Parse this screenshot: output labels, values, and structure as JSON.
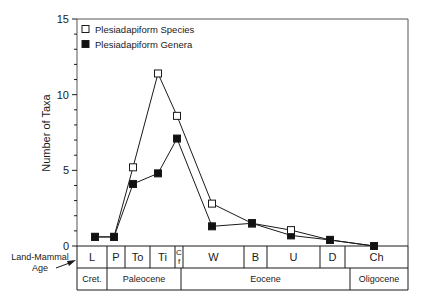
{
  "chart_data": {
    "type": "line",
    "title": "",
    "xlabel": "Land-Mammal Age",
    "ylabel": "Number of Taxa",
    "ylim": [
      0,
      15
    ],
    "yticks": [
      0,
      5,
      10,
      15
    ],
    "grid": false,
    "legend_position": "top-left",
    "categories": [
      "L",
      "P",
      "To",
      "Ti",
      "Cf",
      "W",
      "B",
      "U",
      "D",
      "Ch"
    ],
    "series": [
      {
        "name": "Plesiadapiform Species",
        "marker": "open-square",
        "values": [
          0.6,
          0.6,
          5.2,
          11.4,
          8.6,
          2.8,
          1.5,
          1.05,
          0.4,
          0.0
        ]
      },
      {
        "name": "Plesiadapiform Genera",
        "marker": "filled-square",
        "values": [
          0.6,
          0.6,
          4.1,
          4.8,
          7.1,
          1.3,
          1.5,
          0.7,
          0.4,
          0.0
        ]
      }
    ],
    "land_mammal_ages": [
      {
        "label": "L",
        "x0": 77,
        "x1": 107
      },
      {
        "label": "P",
        "x0": 107,
        "x1": 125
      },
      {
        "label": "To",
        "x0": 125,
        "x1": 150
      },
      {
        "label": "Ti",
        "x0": 150,
        "x1": 175
      },
      {
        "label": "C\nf",
        "x0": 175,
        "x1": 183
      },
      {
        "label": "W",
        "x0": 183,
        "x1": 244
      },
      {
        "label": "B",
        "x0": 244,
        "x1": 267
      },
      {
        "label": "U",
        "x0": 267,
        "x1": 320
      },
      {
        "label": "D",
        "x0": 320,
        "x1": 345
      },
      {
        "label": "Ch",
        "x0": 345,
        "x1": 408
      }
    ],
    "epochs": [
      {
        "label": "Cret.",
        "x0": 77,
        "x1": 107
      },
      {
        "label": "Paleocene",
        "x0": 107,
        "x1": 181
      },
      {
        "label": "Eocene",
        "x0": 181,
        "x1": 350
      },
      {
        "label": "Oligocene",
        "x0": 350,
        "x1": 408
      }
    ],
    "point_x": [
      95,
      114,
      133,
      158,
      177,
      212,
      252,
      291,
      330,
      374
    ]
  },
  "labels": {
    "row_label_line1": "Land-Mammal",
    "row_label_line2": "Age"
  }
}
